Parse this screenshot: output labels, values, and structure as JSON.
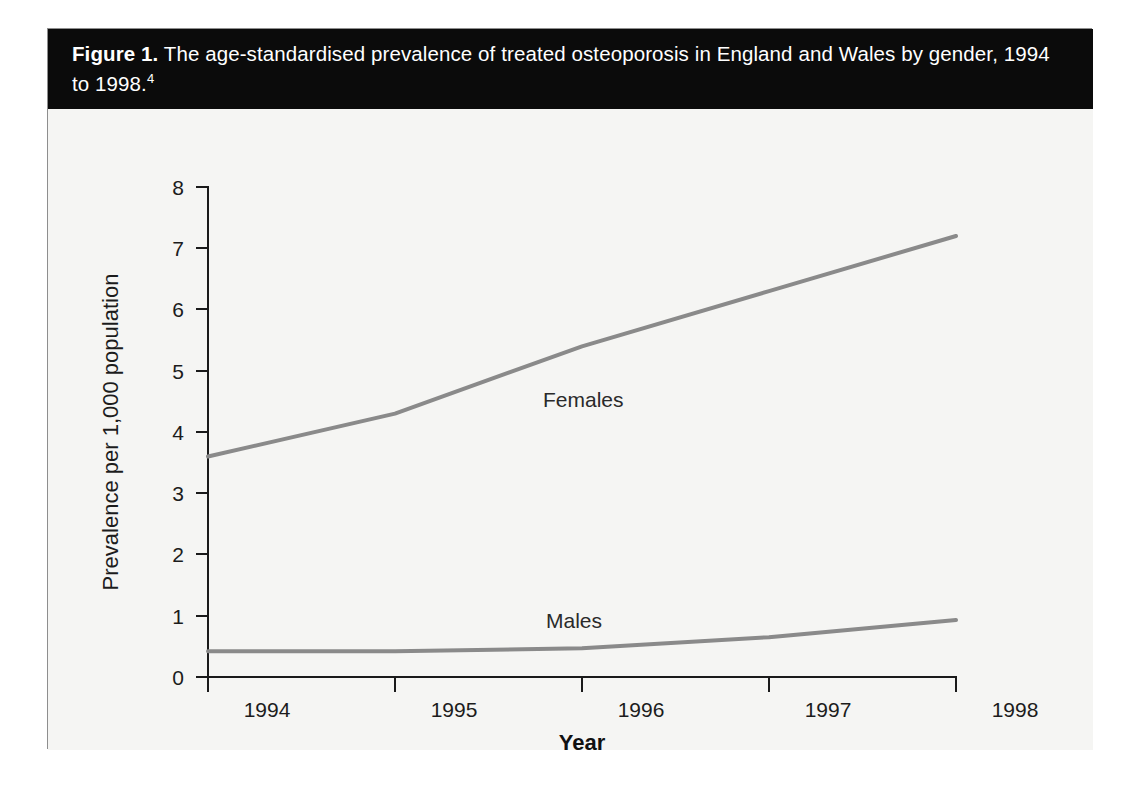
{
  "figure": {
    "label": "Figure 1.",
    "caption": " The age-standardised prevalence of treated osteoporosis in England and Wales by gender, 1994 to 1998.",
    "footnote_marker": "4"
  },
  "colors": {
    "caption_band": "#0b0b0b",
    "caption_text": "#ffffff",
    "plot_background": "#f5f5f3",
    "axis": "#1a1a1a",
    "series_line": "#8a8a8a",
    "figure_border": "#8e8e8e"
  },
  "chart_data": {
    "type": "line",
    "title": "The age-standardised prevalence of treated osteoporosis in England and Wales by gender, 1994 to 1998.",
    "xlabel": "Year",
    "ylabel": "Prevalence per 1,000 population",
    "categories": [
      "1994",
      "1995",
      "1996",
      "1997",
      "1998"
    ],
    "x": [
      1994,
      1995,
      1996,
      1997,
      1998
    ],
    "xlim": [
      1994,
      1998
    ],
    "ylim": [
      0,
      8
    ],
    "yticks": [
      0,
      1,
      2,
      3,
      4,
      5,
      6,
      7,
      8
    ],
    "ytick_labels": [
      "0",
      "1",
      "2",
      "3",
      "4",
      "5",
      "6",
      "7",
      "8"
    ],
    "xtick_labels": [
      "1994",
      "1995",
      "1996",
      "1997",
      "1998"
    ],
    "grid": false,
    "legend": "inline-labels",
    "series": [
      {
        "name": "Females",
        "values": [
          3.6,
          4.3,
          5.4,
          6.3,
          7.2
        ],
        "color": "#8a8a8a",
        "label_text": "Females"
      },
      {
        "name": "Males",
        "values": [
          0.42,
          0.42,
          0.47,
          0.65,
          0.93
        ],
        "color": "#8a8a8a",
        "label_text": "Males"
      }
    ]
  },
  "axis": {
    "y_title": "Prevalence per 1,000 population",
    "x_title": "Year"
  }
}
